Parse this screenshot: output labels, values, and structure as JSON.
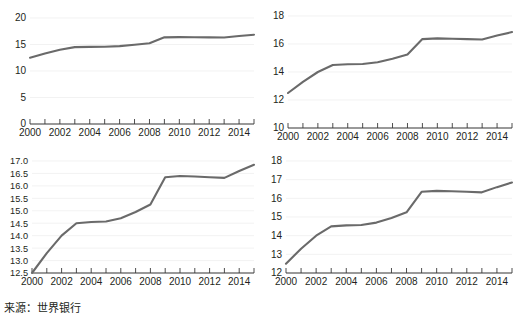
{
  "figure": {
    "title_cropped": "",
    "source_note": "来源：世界银行",
    "background_color": "#ffffff",
    "line_color": "#6a6a6a",
    "gridline_color": "#ececec",
    "axis_color": "#3a3a3a"
  },
  "chart_data": [
    {
      "id": "panel-top-left",
      "type": "line",
      "title": "",
      "xlabel": "",
      "ylabel": "",
      "grid": true,
      "legend": "none",
      "xlim": [
        2000,
        2015
      ],
      "ylim": [
        0,
        20
      ],
      "yticks": [
        0,
        5,
        10,
        15,
        20
      ],
      "ytick_labels": [
        "0",
        "5",
        "10",
        "15",
        "20"
      ],
      "xticks": [
        2000,
        2002,
        2004,
        2006,
        2008,
        2010,
        2012,
        2014
      ],
      "xtick_labels": [
        "2000",
        "2002",
        "2004",
        "2006",
        "2008",
        "2010",
        "2012",
        "2014"
      ],
      "x": [
        2000,
        2001,
        2002,
        2003,
        2004,
        2005,
        2006,
        2007,
        2008,
        2009,
        2010,
        2011,
        2012,
        2013,
        2014,
        2015
      ],
      "values": [
        12.5,
        13.3,
        14.0,
        14.5,
        14.55,
        14.57,
        14.7,
        14.95,
        15.25,
        16.35,
        16.4,
        16.38,
        16.35,
        16.32,
        16.6,
        16.85
      ]
    },
    {
      "id": "panel-top-right",
      "type": "line",
      "title": "",
      "xlabel": "",
      "ylabel": "",
      "grid": true,
      "legend": "none",
      "xlim": [
        2000,
        2015
      ],
      "ylim": [
        10,
        18
      ],
      "yticks": [
        10,
        12,
        14,
        16,
        18
      ],
      "ytick_labels": [
        "10",
        "12",
        "14",
        "16",
        "18"
      ],
      "xticks": [
        2000,
        2002,
        2004,
        2006,
        2008,
        2010,
        2012,
        2014
      ],
      "xtick_labels": [
        "2000",
        "2002",
        "2004",
        "2006",
        "2008",
        "2010",
        "2012",
        "2014"
      ],
      "x": [
        2000,
        2001,
        2002,
        2003,
        2004,
        2005,
        2006,
        2007,
        2008,
        2009,
        2010,
        2011,
        2012,
        2013,
        2014,
        2015
      ],
      "values": [
        12.5,
        13.3,
        14.0,
        14.5,
        14.55,
        14.57,
        14.7,
        14.95,
        15.25,
        16.35,
        16.4,
        16.38,
        16.35,
        16.32,
        16.6,
        16.85
      ]
    },
    {
      "id": "panel-bottom-left",
      "type": "line",
      "title": "",
      "xlabel": "",
      "ylabel": "",
      "grid": true,
      "legend": "none",
      "xlim": [
        2000,
        2015
      ],
      "ylim": [
        12.5,
        17.0
      ],
      "yticks": [
        12.5,
        13.0,
        13.5,
        14.0,
        14.5,
        15.0,
        15.5,
        16.0,
        16.5,
        17.0
      ],
      "ytick_labels": [
        "12.5",
        "13.0",
        "13.5",
        "14.0",
        "14.5",
        "15.0",
        "15.5",
        "16.0",
        "16.5",
        "17.0"
      ],
      "xticks": [
        2000,
        2002,
        2004,
        2006,
        2008,
        2010,
        2012,
        2014
      ],
      "xtick_labels": [
        "2000",
        "2002",
        "2004",
        "2006",
        "2008",
        "2010",
        "2012",
        "2014"
      ],
      "x": [
        2000,
        2001,
        2002,
        2003,
        2004,
        2005,
        2006,
        2007,
        2008,
        2009,
        2010,
        2011,
        2012,
        2013,
        2014,
        2015
      ],
      "values": [
        12.5,
        13.3,
        14.0,
        14.5,
        14.55,
        14.57,
        14.7,
        14.95,
        15.25,
        16.35,
        16.4,
        16.38,
        16.35,
        16.32,
        16.6,
        16.85
      ]
    },
    {
      "id": "panel-bottom-right",
      "type": "line",
      "title": "",
      "xlabel": "",
      "ylabel": "",
      "grid": true,
      "legend": "none",
      "xlim": [
        2000,
        2015
      ],
      "ylim": [
        12,
        18
      ],
      "yticks": [
        12,
        13,
        14,
        15,
        16,
        17,
        18
      ],
      "ytick_labels": [
        "12",
        "13",
        "14",
        "15",
        "16",
        "17",
        "18"
      ],
      "xticks": [
        2000,
        2002,
        2004,
        2006,
        2008,
        2010,
        2012,
        2014
      ],
      "xtick_labels": [
        "2000",
        "2002",
        "2004",
        "2006",
        "2008",
        "2010",
        "2012",
        "2014"
      ],
      "x": [
        2000,
        2001,
        2002,
        2003,
        2004,
        2005,
        2006,
        2007,
        2008,
        2009,
        2010,
        2011,
        2012,
        2013,
        2014,
        2015
      ],
      "values": [
        12.5,
        13.3,
        14.0,
        14.5,
        14.55,
        14.57,
        14.7,
        14.95,
        15.25,
        16.35,
        16.4,
        16.38,
        16.35,
        16.32,
        16.6,
        16.85
      ]
    }
  ]
}
